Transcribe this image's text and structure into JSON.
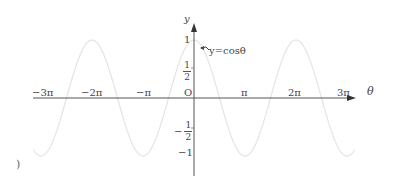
{
  "chart_data": {
    "type": "line",
    "title": "",
    "xlabel": "θ",
    "ylabel": "y",
    "origin_label": "O",
    "curve_label": "y=cosθ",
    "function": "cos",
    "x_range": [
      -3.15,
      3.15
    ],
    "x_units": "π",
    "ylim": [
      -1,
      1
    ],
    "grid": false,
    "legend": "annotation next to curve",
    "x_ticks": [
      {
        "value": -3,
        "label": "−3π"
      },
      {
        "value": -2,
        "label": "−2π"
      },
      {
        "value": -1,
        "label": "−π"
      },
      {
        "value": 1,
        "label": "π"
      },
      {
        "value": 2,
        "label": "2π"
      },
      {
        "value": 3,
        "label": "3π"
      }
    ],
    "y_ticks": [
      {
        "value": 1,
        "label": "1"
      },
      {
        "value": 0.5,
        "label": "1/2"
      },
      {
        "value": -0.5,
        "label": "−1/2"
      },
      {
        "value": -1,
        "label": "−1"
      }
    ],
    "key_points": {
      "x_multiples_of_pi": [
        -3,
        -2,
        -1,
        0,
        1,
        2,
        3
      ],
      "y": [
        -1,
        1,
        -1,
        1,
        -1,
        1,
        -1
      ]
    },
    "series": [
      {
        "name": "y=cosθ",
        "x_multiples_of_pi": [
          -3,
          -2.5,
          -2,
          -1.5,
          -1,
          -0.5,
          0,
          0.5,
          1,
          1.5,
          2,
          2.5,
          3
        ],
        "values": [
          -1,
          0,
          1,
          0,
          -1,
          0,
          1,
          0,
          -1,
          0,
          1,
          0,
          -1
        ]
      }
    ]
  },
  "labels": {
    "y_axis": "y",
    "x_axis": "θ",
    "origin": "O",
    "curve": "y=cosθ",
    "x_ticks": [
      "−3π",
      "−2π",
      "−π",
      "π",
      "2π",
      "3π"
    ],
    "y_one": "1",
    "y_neg_one": "−1",
    "half_num": "1",
    "half_den": "2",
    "minus_sign": "−",
    "stray_mark": ")"
  }
}
